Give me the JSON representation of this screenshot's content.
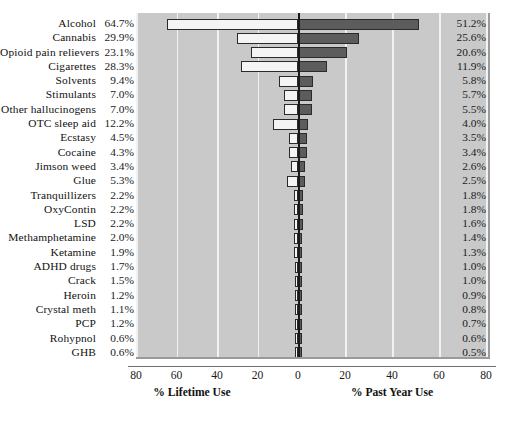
{
  "chart_data": {
    "type": "bar",
    "title": "",
    "subtitle": "",
    "orientation": "horizontal-diverging",
    "grid": true,
    "legend_position": "none",
    "xlabel_left": "% Lifetime Use",
    "xlabel_right": "% Past Year Use",
    "ylabel": "",
    "axis_ticks_left": [
      "80",
      "60",
      "40",
      "20",
      "0"
    ],
    "axis_ticks_right": [
      "20",
      "40",
      "60",
      "80"
    ],
    "axis_ticks_all": [
      "80",
      "60",
      "40",
      "20",
      "0",
      "20",
      "40",
      "60",
      "80"
    ],
    "xlim_left": [
      0,
      80
    ],
    "xlim_right": [
      0,
      80
    ],
    "categories": [
      "Alcohol",
      "Cannabis",
      "Opioid pain relievers",
      "Cigarettes",
      "Solvents",
      "Stimulants",
      "Other hallucinogens",
      "OTC sleep aid",
      "Ecstasy",
      "Cocaine",
      "Jimson weed",
      "Glue",
      "Tranquillizers",
      "OxyContin",
      "LSD",
      "Methamphetamine",
      "Ketamine",
      "ADHD drugs",
      "Crack",
      "Heroin",
      "Crystal meth",
      "PCP",
      "Rohypnol",
      "GHB"
    ],
    "series": [
      {
        "name": "% Lifetime Use",
        "side": "left",
        "color": "#f4f4f4",
        "values": [
          64.7,
          29.9,
          23.1,
          28.3,
          9.4,
          7.0,
          7.0,
          12.2,
          4.5,
          4.3,
          3.4,
          5.3,
          2.2,
          2.2,
          2.2,
          2.0,
          1.9,
          1.7,
          1.5,
          1.2,
          1.1,
          1.2,
          0.6,
          0.6
        ],
        "labels": [
          "64.7%",
          "29.9%",
          "23.1%",
          "28.3%",
          "9.4%",
          "7.0%",
          "7.0%",
          "12.2%",
          "4.5%",
          "4.3%",
          "3.4%",
          "5.3%",
          "2.2%",
          "2.2%",
          "2.2%",
          "2.0%",
          "1.9%",
          "1.7%",
          "1.5%",
          "1.2%",
          "1.1%",
          "1.2%",
          "0.6%",
          "0.6%"
        ]
      },
      {
        "name": "% Past Year Use",
        "side": "right",
        "color": "#5c5c5c",
        "values": [
          51.2,
          25.6,
          20.6,
          11.9,
          5.8,
          5.7,
          5.5,
          4.0,
          3.5,
          3.4,
          2.6,
          2.5,
          1.8,
          1.8,
          1.6,
          1.4,
          1.3,
          1.0,
          1.0,
          0.9,
          0.8,
          0.7,
          0.6,
          0.5
        ],
        "labels": [
          "51.2%",
          "25.6%",
          "20.6%",
          "11.9%",
          "5.8%",
          "5.7%",
          "5.5%",
          "4.0%",
          "3.5%",
          "3.4%",
          "2.6%",
          "2.5%",
          "1.8%",
          "1.8%",
          "1.6%",
          "1.4%",
          "1.3%",
          "1.0%",
          "1.0%",
          "0.9%",
          "0.8%",
          "0.7%",
          "0.6%",
          "0.5%"
        ]
      }
    ]
  },
  "colors": {
    "plot_background": "#c9c9c9",
    "gridline": "#f2f2f2",
    "zero_axis": "#1a1a1a",
    "bar_left_fill": "#f4f4f4",
    "bar_right_fill": "#5c5c5c",
    "bar_outline": "#2a2a2a",
    "page_background": "#ffffff",
    "text": "#111111"
  }
}
